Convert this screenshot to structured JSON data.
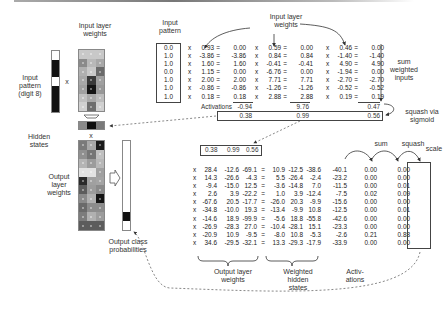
{
  "labels": {
    "input_pattern_left": "Input\npattern\n(digit 8)",
    "input_layer_weights_left": "Input layer\nweights",
    "hidden_states": "Hidden\nstates",
    "output_layer_weights_left": "Output\nlayer\nweights",
    "output_class_probabilities": "Output class\nprobabilities",
    "input_pattern_table": "Input\npattern",
    "input_layer_weights_table": "Input layer\nweights",
    "sum_weighted_inputs": "sum\nweighted\ninputs",
    "activations": "Activations",
    "squash_via_sigmoid": "squash via\nsigmoid",
    "sum": "sum",
    "squash": "squash",
    "scale": "scale",
    "output_layer_weights_bottom": "Output layer\nweights",
    "weighted_hidden_states": "Weighted\nhidden\nstates",
    "activations_bottom": "Activ-\nations",
    "times": "x",
    "equals": "="
  },
  "input_pattern": [
    "0.0",
    "1.0",
    "1.0",
    "0.0",
    "1.0",
    "1.0",
    "1.0"
  ],
  "input_layer": {
    "weights": [
      [
        "0.93",
        "0.59",
        "0.46"
      ],
      [
        "-3.86",
        "0.84",
        "-1.40"
      ],
      [
        "1.60",
        "-0.41",
        "4.90"
      ],
      [
        "1.15",
        "-6.76",
        "-1.94"
      ],
      [
        "2.00",
        "7.71",
        "-2.70"
      ],
      [
        "-0.86",
        "-1.26",
        "-0.52"
      ],
      [
        "0.18",
        "2.88",
        "0.19"
      ]
    ],
    "products": [
      [
        "0.00",
        "0.00",
        "0.00"
      ],
      [
        "-3.86",
        "0.84",
        "-1.40"
      ],
      [
        "1.60",
        "-0.41",
        "4.90"
      ],
      [
        "0.00",
        "0.00",
        "0.00"
      ],
      [
        "2.00",
        "7.71",
        "-2.70"
      ],
      [
        "-0.86",
        "-1.26",
        "-0.52"
      ],
      [
        "0.18",
        "2.88",
        "0.19"
      ]
    ],
    "sums": [
      "-0.94",
      "9.76",
      "0.47"
    ],
    "sigmoid": [
      "0.38",
      "0.99",
      "0.56"
    ]
  },
  "hidden_state_vector": [
    "0.38",
    "0.99",
    "0.56"
  ],
  "output_layer": {
    "weights": [
      [
        "28.4",
        "-12.6",
        "-69.1"
      ],
      [
        "14.3",
        "-26.6",
        "-4.3"
      ],
      [
        "-9.4",
        "-15.0",
        "12.5"
      ],
      [
        "2.6",
        "3.9",
        "-22.2"
      ],
      [
        "-67.6",
        "20.5",
        "-17.7"
      ],
      [
        "-34.8",
        "-10.0",
        "19.3"
      ],
      [
        "-14.6",
        "18.9",
        "-99.9"
      ],
      [
        "-26.9",
        "-28.3",
        "27.0"
      ],
      [
        "-20.9",
        "10.9",
        "-9.5"
      ],
      [
        "34.6",
        "-29.5",
        "-32.1"
      ]
    ],
    "weighted": [
      [
        "10.9",
        "-12.5",
        "-38.6"
      ],
      [
        "5.5",
        "-26.4",
        "-2.4"
      ],
      [
        "-3.6",
        "-14.8",
        "7.0"
      ],
      [
        "1.0",
        "3.9",
        "-12.4"
      ],
      [
        "-26.0",
        "20.3",
        "-9.9"
      ],
      [
        "-13.4",
        "-9.9",
        "10.8"
      ],
      [
        "-5.6",
        "18.8",
        "-55.8"
      ],
      [
        "-10.4",
        "-28.1",
        "15.1"
      ],
      [
        "-8.0",
        "10.8",
        "-5.3"
      ],
      [
        "13.3",
        "-29.3",
        "-17.9"
      ]
    ],
    "sums": [
      "-40.1",
      "-23.2",
      "-11.5",
      "-7.5",
      "-15.6",
      "-12.5",
      "-42.6",
      "-23.3",
      "-2.6",
      "-33.9"
    ],
    "squashed": [
      "0.00",
      "0.00",
      "0.00",
      "0.02",
      "0.00",
      "0.00",
      "0.00",
      "0.00",
      "0.21",
      "0.00"
    ],
    "scaled": [
      "0.00",
      "0.00",
      "0.01",
      "0.09",
      "0.00",
      "0.01",
      "0.00",
      "0.00",
      "0.88",
      "0.00"
    ]
  },
  "heatmaps": {
    "input_pattern_cells": [
      "#ffffff",
      "#111111",
      "#111111",
      "#ffffff",
      "#111111",
      "#111111",
      "#111111"
    ],
    "input_weights": [
      [
        "#c8c8c8",
        "#c8c8c8",
        "#c8c8c8"
      ],
      [
        "#8a8a8a",
        "#b8b8b8",
        "#a8a8a8"
      ],
      [
        "#b0b0b0",
        "#c8c8c8",
        "#6a6a6a"
      ],
      [
        "#a8a8a8",
        "#3a3a3a",
        "#a0a0a0"
      ],
      [
        "#a0a0a0",
        "#151515",
        "#989898"
      ],
      [
        "#c0c0c0",
        "#a8a8a8",
        "#bcbcbc"
      ],
      [
        "#d0d0d0",
        "#6e6e6e",
        "#d0d0d0"
      ]
    ],
    "hidden": [
      "#8a8a8a",
      "#0e0e0e",
      "#7a7a7a"
    ],
    "output_weights": [
      [
        "#7a7a7a",
        "#a8a8a8",
        "#1a1a1a"
      ],
      [
        "#909090",
        "#767676",
        "#c0c0c0"
      ],
      [
        "#b4b4b4",
        "#9c9c9c",
        "#b8b8b8"
      ],
      [
        "#e2e2e2",
        "#e2e2e2",
        "#a0a0a0"
      ],
      [
        "#2a2a2a",
        "#a0a0a0",
        "#a4a4a4"
      ],
      [
        "#5c5c5c",
        "#9c9c9c",
        "#8a8a8a"
      ],
      [
        "#8a8a8a",
        "#b0b0b0",
        "#141414"
      ],
      [
        "#6a6a6a",
        "#8c8c8c",
        "#8c8c8c"
      ],
      [
        "#7c7c7c",
        "#b0b0b0",
        "#9c9c9c"
      ],
      [
        "#5c5c5c",
        "#5c5c5c",
        "#5c5c5c"
      ]
    ],
    "output_probs": [
      "#ffffff",
      "#ffffff",
      "#ffffff",
      "#ffffff",
      "#ffffff",
      "#ffffff",
      "#ffffff",
      "#ffffff",
      "#111111",
      "#ffffff"
    ]
  }
}
